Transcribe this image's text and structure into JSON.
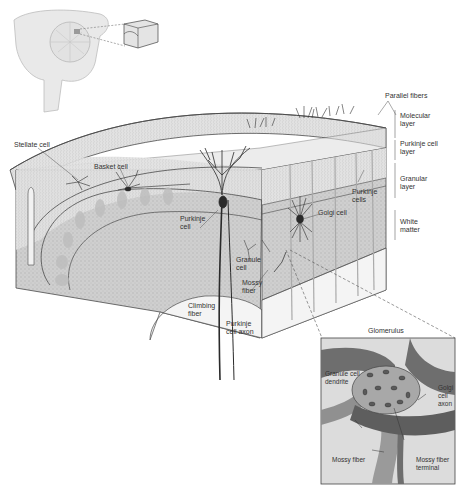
{
  "figure": {
    "inset_brain": {
      "label": "sagittal brain with cerebellum location"
    },
    "layer_labels": [
      {
        "id": "molecular",
        "text": "Molecular\nlayer"
      },
      {
        "id": "purkinje",
        "text": "Purkinje cell\nlayer"
      },
      {
        "id": "granular",
        "text": "Granular\nlayer"
      },
      {
        "id": "white",
        "text": "White\nmatter"
      }
    ],
    "cell_labels": {
      "parallel_fibers": "Parallel fibers",
      "stellate_cell": "Stellate cell",
      "basket_cell": "Basket cell",
      "purkinje_cell": "Purkinje\ncell",
      "purkinje_cells": "Purkinje\ncells",
      "golgi_cell": "Golgi cell",
      "granule_cell": "Granule\ncell",
      "mossy_fiber": "Mossy\nfiber",
      "climbing_fiber": "Climbing\nfiber",
      "purkinje_axon": "Purkinje\ncell axon"
    },
    "glomerulus": {
      "title": "Glomerulus",
      "granule_dendrite": "Granule cell\ndendrite",
      "golgi_axon": "Golgi\ncell\naxon",
      "mossy_fiber": "Mossy fiber",
      "mossy_terminal": "Mossy fiber\nterminal"
    },
    "colors": {
      "tissue_light": "#e6e6e6",
      "tissue_mid": "#d2d2d2",
      "granular_fill": "#c8c8c8",
      "line": "#4a4a4a",
      "cell_dark": "#2a2a2a",
      "glom_bg": "#d9d9d9",
      "glom_dark": "#6e6e6e",
      "glom_mid": "#9a9a9a"
    }
  }
}
